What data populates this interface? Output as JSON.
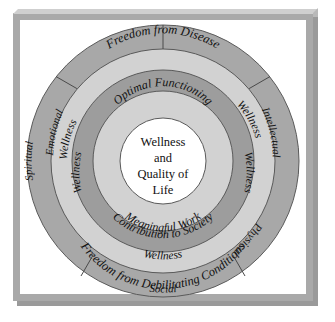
{
  "figure": {
    "colors": {
      "plate": "#a9a9a9",
      "canvas": "#ffffff",
      "ring_outer": "#a8a8a8",
      "ring_light": "#d2d2d2",
      "ring_dark": "#9d9d9d",
      "ring_inner": "#d2d2d2",
      "core": "#ffffff",
      "stroke": "#5a5a5a",
      "text": "#111111"
    }
  },
  "core": {
    "line1": "Wellness",
    "line2": "and",
    "line3": "Quality of",
    "line4": "Life"
  },
  "inner_ring": {
    "top": "Optimal Functioning",
    "bottom_line1": "Meaningful Work",
    "bottom_line2": "Contribution to Society"
  },
  "middle_ring": {
    "labels": [
      "Wellness",
      "Wellness",
      "Wellness",
      "Wellness",
      "Wellness"
    ]
  },
  "light_ring": {
    "top": "Freedom from Disease",
    "bottom": "Freedom from Debilitating Conditions"
  },
  "outer_ring": {
    "segments": [
      "Emotional",
      "Intellectual",
      "Physical",
      "Social",
      "Spiritual"
    ]
  }
}
